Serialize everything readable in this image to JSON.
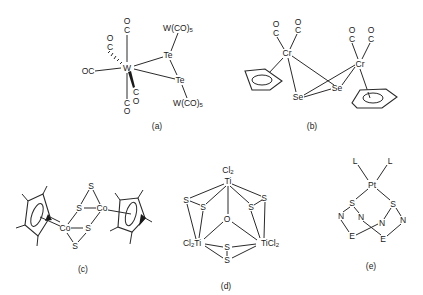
{
  "figure": {
    "panels": [
      {
        "id": "a",
        "label": "(a)",
        "atoms": {
          "W": "W",
          "Te1": "Te",
          "Te2": "Te",
          "WCO5_top": "W(CO)",
          "WCO5_bot": "W(CO)",
          "sub5": "5",
          "OC_left": "OC",
          "C": "C",
          "O": "O"
        }
      },
      {
        "id": "b",
        "label": "(b)",
        "atoms": {
          "Cr": "Cr",
          "Se": "Se",
          "C": "C",
          "O": "O"
        }
      },
      {
        "id": "c",
        "label": "(c)",
        "atoms": {
          "Co": "Co",
          "S": "S"
        }
      },
      {
        "id": "d",
        "label": "(d)",
        "atoms": {
          "Ti": "Ti",
          "Cl2": "Cl",
          "sub2": "2",
          "S": "S",
          "O": "O",
          "Cl2Ti": "Cl",
          "TiCl2": "TiCl"
        }
      },
      {
        "id": "e",
        "label": "(e)",
        "atoms": {
          "Pt": "Pt",
          "L": "L",
          "S": "S",
          "N": "N",
          "E": "E"
        }
      }
    ]
  }
}
